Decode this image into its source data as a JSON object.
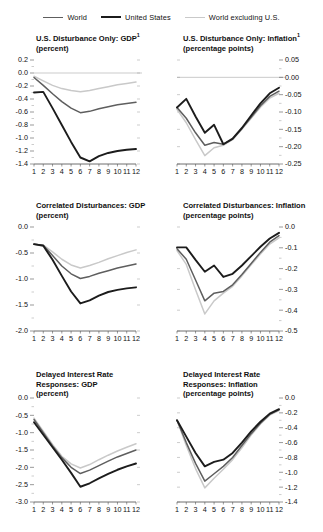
{
  "legend": {
    "items": [
      {
        "label": "World",
        "color": "#5e5e5e",
        "width": 1.6
      },
      {
        "label": "United States",
        "color": "#1c1c1c",
        "width": 2.0
      },
      {
        "label": "World excluding U.S.",
        "color": "#c9c9c9",
        "width": 1.6
      }
    ]
  },
  "colors": {
    "world": "#5e5e5e",
    "united_states": "#1c1c1c",
    "world_excluding_us": "#c9c9c9",
    "axis": "#4a4a4a",
    "zero_line": "#b5b5b5",
    "text": "#111111"
  },
  "chart_data": [
    {
      "id": "us-disturbance-gdp",
      "type": "line",
      "title": "U.S. Disturbance Only: GDP",
      "title_footnote": "1",
      "subtitle": "(percent)",
      "xlabel": "",
      "ylabel": "",
      "units": "percent",
      "axis_side": "left",
      "x": [
        1,
        2,
        3,
        4,
        5,
        6,
        7,
        8,
        9,
        10,
        11,
        12
      ],
      "xticks": [
        "1",
        "2",
        "3",
        "4",
        "5",
        "6",
        "7",
        "8",
        "9",
        "10",
        "11",
        "12"
      ],
      "ylim": [
        -1.4,
        0.2
      ],
      "yticks": [
        0.2,
        0.0,
        -0.2,
        -0.4,
        -0.6,
        -0.8,
        -1.0,
        -1.2,
        -1.4
      ],
      "ytick_labels": [
        "0.2",
        "0.0",
        "-0.2",
        "-0.4",
        "-0.6",
        "-0.8",
        "-1.0",
        "-1.2",
        "-1.4"
      ],
      "grid": false,
      "series": [
        {
          "name": "World",
          "values": [
            -0.07,
            -0.19,
            -0.32,
            -0.44,
            -0.54,
            -0.61,
            -0.59,
            -0.55,
            -0.52,
            -0.49,
            -0.47,
            -0.45
          ]
        },
        {
          "name": "United States",
          "values": [
            -0.3,
            -0.29,
            -0.54,
            -0.8,
            -1.06,
            -1.3,
            -1.36,
            -1.28,
            -1.23,
            -1.2,
            -1.18,
            -1.17
          ]
        },
        {
          "name": "World excluding U.S.",
          "values": [
            -0.05,
            -0.12,
            -0.19,
            -0.24,
            -0.27,
            -0.29,
            -0.27,
            -0.24,
            -0.21,
            -0.18,
            -0.16,
            -0.14
          ]
        }
      ]
    },
    {
      "id": "us-disturbance-inflation",
      "type": "line",
      "title": "U.S. Disturbance Only: Inflation",
      "title_footnote": "1",
      "subtitle": "(percentage points)",
      "xlabel": "",
      "ylabel": "",
      "units": "percentage points",
      "axis_side": "right",
      "x": [
        1,
        2,
        3,
        4,
        5,
        6,
        7,
        8,
        9,
        10,
        11,
        12
      ],
      "xticks": [
        "1",
        "2",
        "3",
        "4",
        "5",
        "6",
        "7",
        "8",
        "9",
        "10",
        "11",
        "12"
      ],
      "ylim": [
        -0.25,
        0.05
      ],
      "yticks": [
        0.05,
        0.0,
        -0.05,
        -0.1,
        -0.15,
        -0.2,
        -0.25
      ],
      "ytick_labels": [
        "0.05",
        "0.00",
        "-0.05",
        "-0.10",
        "-0.15",
        "-0.20",
        "-0.25"
      ],
      "grid": false,
      "series": [
        {
          "name": "World",
          "values": [
            -0.087,
            -0.118,
            -0.16,
            -0.196,
            -0.188,
            -0.193,
            -0.178,
            -0.148,
            -0.115,
            -0.082,
            -0.055,
            -0.04
          ]
        },
        {
          "name": "United States",
          "values": [
            -0.087,
            -0.062,
            -0.113,
            -0.16,
            -0.137,
            -0.193,
            -0.177,
            -0.146,
            -0.11,
            -0.075,
            -0.046,
            -0.03
          ]
        },
        {
          "name": "World excluding U.S.",
          "values": [
            -0.092,
            -0.131,
            -0.18,
            -0.226,
            -0.203,
            -0.196,
            -0.18,
            -0.15,
            -0.118,
            -0.086,
            -0.06,
            -0.046
          ]
        }
      ]
    },
    {
      "id": "correlated-disturbances-gdp",
      "type": "line",
      "title": "Correlated Disturbances: GDP",
      "title_footnote": "",
      "subtitle": "(percent)",
      "xlabel": "",
      "ylabel": "",
      "units": "percent",
      "axis_side": "left",
      "x": [
        1,
        2,
        3,
        4,
        5,
        6,
        7,
        8,
        9,
        10,
        11,
        12
      ],
      "xticks": [
        "1",
        "2",
        "3",
        "4",
        "5",
        "6",
        "7",
        "8",
        "9",
        "10",
        "11",
        "12"
      ],
      "ylim": [
        -2.0,
        0.0
      ],
      "yticks": [
        0.0,
        -0.5,
        -1.0,
        -1.5,
        -2.0
      ],
      "ytick_labels": [
        "0.0",
        "-0.5",
        "-1.0",
        "-1.5",
        "-2.0"
      ],
      "grid": false,
      "series": [
        {
          "name": "World",
          "values": [
            -0.33,
            -0.35,
            -0.55,
            -0.75,
            -0.9,
            -0.99,
            -0.95,
            -0.89,
            -0.84,
            -0.79,
            -0.75,
            -0.71
          ]
        },
        {
          "name": "United States",
          "values": [
            -0.33,
            -0.36,
            -0.63,
            -0.94,
            -1.24,
            -1.47,
            -1.41,
            -1.32,
            -1.25,
            -1.21,
            -1.18,
            -1.16
          ]
        },
        {
          "name": "World excluding U.S.",
          "values": [
            -0.33,
            -0.35,
            -0.48,
            -0.62,
            -0.73,
            -0.79,
            -0.74,
            -0.68,
            -0.61,
            -0.55,
            -0.49,
            -0.44
          ]
        }
      ]
    },
    {
      "id": "correlated-disturbances-inflation",
      "type": "line",
      "title": "Correlated Disturbances: Inflation",
      "title_footnote": "",
      "subtitle": "(percentage points)",
      "xlabel": "",
      "ylabel": "",
      "units": "percentage points",
      "axis_side": "right",
      "x": [
        1,
        2,
        3,
        4,
        5,
        6,
        7,
        8,
        9,
        10,
        11,
        12
      ],
      "xticks": [
        "1",
        "2",
        "3",
        "4",
        "5",
        "6",
        "7",
        "8",
        "9",
        "10",
        "11",
        "12"
      ],
      "ylim": [
        -0.5,
        0.0
      ],
      "yticks": [
        0.0,
        -0.1,
        -0.2,
        -0.3,
        -0.4,
        -0.5
      ],
      "ytick_labels": [
        "0.0",
        "-0.1",
        "-0.2",
        "-0.3",
        "-0.4",
        "-0.5"
      ],
      "grid": false,
      "series": [
        {
          "name": "World",
          "values": [
            -0.105,
            -0.155,
            -0.255,
            -0.355,
            -0.318,
            -0.31,
            -0.278,
            -0.228,
            -0.175,
            -0.122,
            -0.073,
            -0.042
          ]
        },
        {
          "name": "United States",
          "values": [
            -0.098,
            -0.098,
            -0.158,
            -0.215,
            -0.185,
            -0.24,
            -0.225,
            -0.185,
            -0.14,
            -0.095,
            -0.055,
            -0.028
          ]
        },
        {
          "name": "World excluding U.S.",
          "values": [
            -0.113,
            -0.18,
            -0.302,
            -0.418,
            -0.355,
            -0.318,
            -0.285,
            -0.235,
            -0.182,
            -0.13,
            -0.082,
            -0.052
          ]
        }
      ]
    },
    {
      "id": "delayed-interest-gdp",
      "type": "line",
      "title": "Delayed Interest Rate",
      "title_line2": "Responses: GDP",
      "title_footnote": "",
      "subtitle": "(percent)",
      "xlabel": "",
      "ylabel": "",
      "units": "percent",
      "axis_side": "left",
      "x": [
        1,
        2,
        3,
        4,
        5,
        6,
        7,
        8,
        9,
        10,
        11,
        12
      ],
      "xticks": [
        "1",
        "2",
        "3",
        "4",
        "5",
        "6",
        "7",
        "8",
        "9",
        "10",
        "11",
        "12"
      ],
      "ylim": [
        -3.0,
        0.0
      ],
      "yticks": [
        0.0,
        -0.5,
        -1.0,
        -1.5,
        -2.0,
        -2.5,
        -3.0
      ],
      "ytick_labels": [
        "0.0",
        "-0.5",
        "-1.0",
        "-1.5",
        "-2.0",
        "-2.5",
        "-3.0"
      ],
      "grid": false,
      "series": [
        {
          "name": "World",
          "values": [
            -0.62,
            -1.0,
            -1.38,
            -1.72,
            -2.0,
            -2.18,
            -2.08,
            -1.95,
            -1.82,
            -1.7,
            -1.6,
            -1.5
          ]
        },
        {
          "name": "United States",
          "values": [
            -0.7,
            -1.06,
            -1.42,
            -1.78,
            -2.16,
            -2.56,
            -2.46,
            -2.32,
            -2.19,
            -2.07,
            -1.97,
            -1.89
          ]
        },
        {
          "name": "World excluding U.S.",
          "values": [
            -0.58,
            -0.96,
            -1.34,
            -1.68,
            -1.9,
            -2.02,
            -1.92,
            -1.78,
            -1.65,
            -1.53,
            -1.42,
            -1.32
          ]
        }
      ]
    },
    {
      "id": "delayed-interest-inflation",
      "type": "line",
      "title": "Delayed Interest Rate",
      "title_line2": "Responses: Inflation",
      "title_footnote": "",
      "subtitle": "(percentage points)",
      "xlabel": "",
      "ylabel": "",
      "units": "percentage points",
      "axis_side": "right",
      "x": [
        1,
        2,
        3,
        4,
        5,
        6,
        7,
        8,
        9,
        10,
        11,
        12
      ],
      "xticks": [
        "1",
        "2",
        "3",
        "4",
        "5",
        "6",
        "7",
        "8",
        "9",
        "10",
        "11",
        "12"
      ],
      "ylim": [
        -1.4,
        0.0
      ],
      "yticks": [
        0.0,
        -0.2,
        -0.4,
        -0.6,
        -0.8,
        -1.0,
        -1.2,
        -1.4
      ],
      "ytick_labels": [
        "0.0",
        "-0.2",
        "-0.4",
        "-0.6",
        "-0.8",
        "-1.0",
        "-1.2",
        "-1.4"
      ],
      "grid": false,
      "series": [
        {
          "name": "World",
          "values": [
            -0.3,
            -0.6,
            -0.88,
            -1.12,
            -1.02,
            -0.92,
            -0.8,
            -0.64,
            -0.48,
            -0.34,
            -0.22,
            -0.16
          ]
        },
        {
          "name": "United States",
          "values": [
            -0.3,
            -0.52,
            -0.74,
            -0.92,
            -0.86,
            -0.83,
            -0.74,
            -0.6,
            -0.45,
            -0.32,
            -0.21,
            -0.15
          ]
        },
        {
          "name": "World excluding U.S.",
          "values": [
            -0.3,
            -0.64,
            -0.95,
            -1.21,
            -1.08,
            -0.96,
            -0.83,
            -0.67,
            -0.5,
            -0.35,
            -0.23,
            -0.17
          ]
        }
      ]
    }
  ]
}
